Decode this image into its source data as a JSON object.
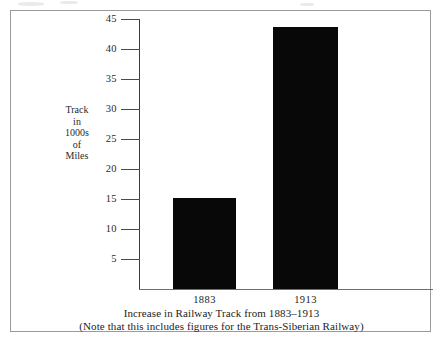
{
  "chart_data": {
    "type": "bar",
    "title": "Increase in Railway Track from 1883–1913",
    "subtitle": "(Note that this includes figures for the Trans-Siberian Railway)",
    "categories": [
      "1883",
      "1913"
    ],
    "values": [
      15.2,
      43.7
    ],
    "xlabel": "",
    "ylabel": "Track in 1000s of Miles",
    "ylabel_lines": [
      "Track",
      "in",
      "1000s",
      "of",
      "Miles"
    ],
    "ylim": [
      0,
      45
    ],
    "yticks": [
      5,
      10,
      15,
      20,
      25,
      30,
      35,
      40,
      45
    ],
    "ytick_labels": [
      "5",
      "10",
      "15",
      "20",
      "25",
      "30",
      "35",
      "40",
      "45"
    ],
    "grid": false,
    "legend": false,
    "bar_color": "#080808",
    "axis_color": "#3a3a3a",
    "background": "#ffffff"
  }
}
